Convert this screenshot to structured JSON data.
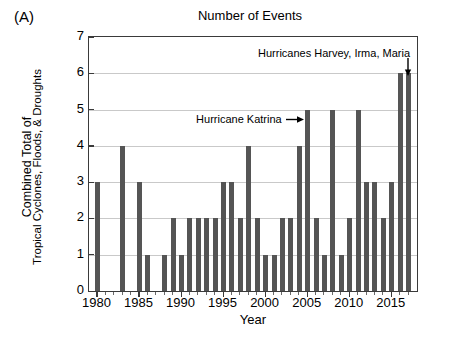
{
  "panel": {
    "label": "(A)"
  },
  "chart_data": {
    "type": "bar",
    "title": "Number of Events",
    "xlabel": "Year",
    "ylabel_line1": "Combined Total of",
    "ylabel_line2": "Tropical Cyclones, Floods, & Droughts",
    "ylim": [
      0,
      7
    ],
    "xlim": [
      1979,
      2018
    ],
    "ytick_labels": [
      "0",
      "1",
      "2",
      "3",
      "4",
      "5",
      "6",
      "7"
    ],
    "ytick_values": [
      0,
      1,
      2,
      3,
      4,
      5,
      6,
      7
    ],
    "xtick_labels": [
      "1980",
      "1985",
      "1990",
      "1995",
      "2000",
      "2005",
      "2010",
      "2015"
    ],
    "xtick_values": [
      1980,
      1985,
      1990,
      1995,
      2000,
      2005,
      2010,
      2015
    ],
    "grid": "horizontal",
    "legend": "none",
    "bar_color": "#555555",
    "axis_color": "#3a3a3a",
    "grid_color": "#c9c9c9",
    "categories": [
      1980,
      1981,
      1982,
      1983,
      1984,
      1985,
      1986,
      1987,
      1988,
      1989,
      1990,
      1991,
      1992,
      1993,
      1994,
      1995,
      1996,
      1997,
      1998,
      1999,
      2000,
      2001,
      2002,
      2003,
      2004,
      2005,
      2006,
      2007,
      2008,
      2009,
      2010,
      2011,
      2012,
      2013,
      2014,
      2015,
      2016,
      2017
    ],
    "values": [
      3,
      0,
      0,
      4,
      0,
      3,
      1,
      0,
      1,
      2,
      1,
      2,
      2,
      2,
      2,
      3,
      3,
      2,
      4,
      2,
      1,
      1,
      2,
      2,
      4,
      5,
      2,
      1,
      5,
      1,
      2,
      5,
      3,
      3,
      2,
      3,
      6,
      6
    ],
    "annotations": [
      {
        "id": "katrina",
        "text": "Hurricane Katrina →",
        "label": "Hurricane Katrina",
        "arrow": "right",
        "target_year": 2005,
        "target_value": 5
      },
      {
        "id": "harvey-irma-maria",
        "text": "Hurricanes Harvey, Irma, Maria",
        "label": "Hurricanes Harvey, Irma, Maria",
        "arrow": "down",
        "target_year": 2017,
        "target_value": 6
      }
    ]
  }
}
